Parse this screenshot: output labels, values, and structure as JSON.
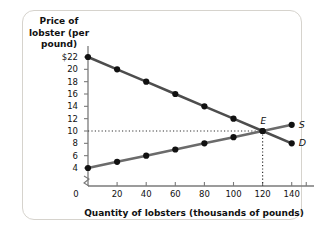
{
  "chart_data": {
    "type": "line",
    "title": "",
    "ylabel": "Price of lobster (per pound)",
    "xlabel": "Quantity of lobsters (thousands of pounds)",
    "x": [
      0,
      20,
      40,
      60,
      80,
      100,
      120,
      140
    ],
    "xlim": [
      0,
      150
    ],
    "ylim": [
      3,
      23
    ],
    "grid": false,
    "y_axis_break": true,
    "x_tick_labels": [
      "0",
      "20",
      "40",
      "60",
      "80",
      "100",
      "120",
      "140"
    ],
    "y_tick_labels": [
      "$22",
      "20",
      "18",
      "16",
      "14",
      "12",
      "10",
      "8",
      "6",
      "4"
    ],
    "y_ticks": [
      22,
      20,
      18,
      16,
      14,
      12,
      10,
      8,
      6,
      4
    ],
    "origin_label": "0",
    "series": [
      {
        "name": "D",
        "label": "D",
        "values": [
          22,
          20,
          18,
          16,
          14,
          12,
          10,
          8
        ],
        "color": "#4d4d4d",
        "markers": true
      },
      {
        "name": "S",
        "label": "S",
        "values": [
          4,
          5,
          6,
          7,
          8,
          9,
          10,
          11
        ],
        "color": "#6b6b6b",
        "markers": true
      }
    ],
    "annotations": [
      {
        "name": "equilibrium",
        "label": "E",
        "x": 120,
        "y": 10,
        "guide_horizontal": true,
        "guide_vertical": true
      }
    ]
  },
  "colors": {
    "frame": "#d6d3cd",
    "axis": "#7a7a7a",
    "demand": "#4d4d4d",
    "supply": "#6b6b6b",
    "marker": "#111111",
    "guide": "#333333"
  }
}
